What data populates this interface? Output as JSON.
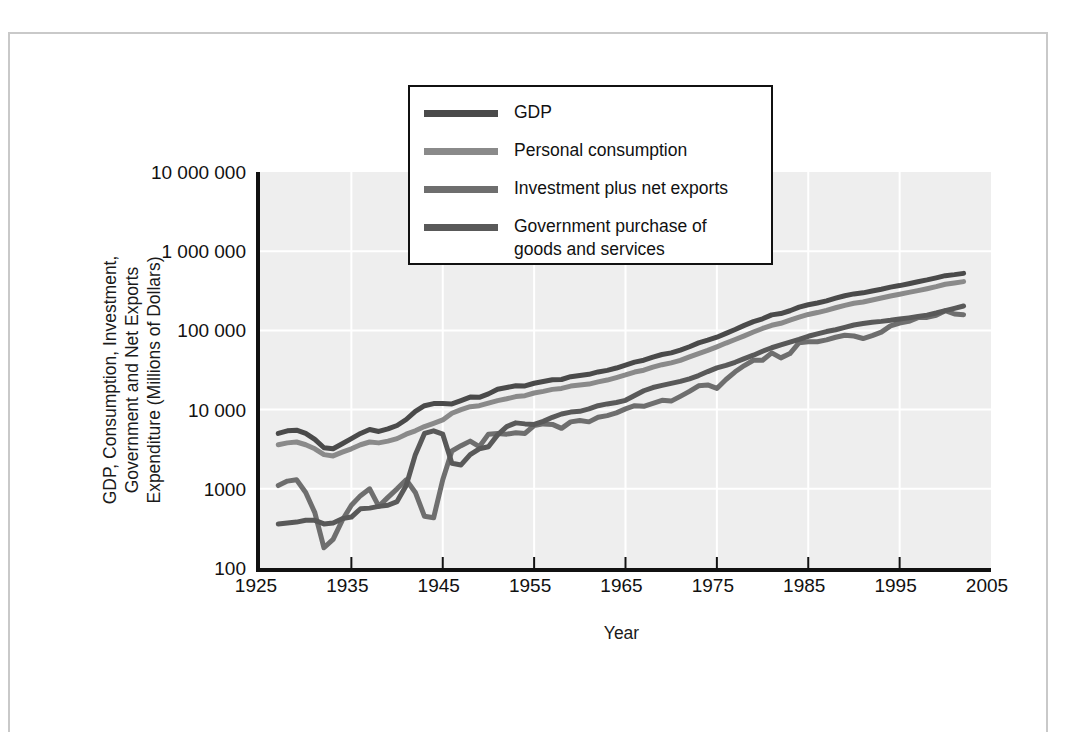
{
  "figure": {
    "x_axis_title": "Year",
    "y_axis_title_lines": [
      "GDP, Consumption, Investment,",
      "Government and Net Exports",
      "Expenditure (Millions of Dollars)"
    ]
  },
  "legend": {
    "entries": [
      {
        "label": "GDP",
        "color": "#4a4a4a"
      },
      {
        "label": "Personal consumption",
        "color": "#8a8a8a"
      },
      {
        "label": "Investment plus net exports",
        "color": "#6e6e6e"
      },
      {
        "label": "Government purchase of\ngoods and services",
        "color": "#595959"
      }
    ]
  },
  "colors": {
    "plot_background": "#eeeeee",
    "gridline": "#ffffff",
    "axis": "#111111",
    "page_border": "#c9c9c9"
  },
  "chart_data": {
    "type": "line",
    "title": "",
    "subtitle": "",
    "xlabel": "Year",
    "ylabel": "GDP, Consumption, Investment, Government and Net Exports Expenditure (Millions of Dollars)",
    "yscale": "log",
    "ylim": [
      100,
      10000000
    ],
    "xlim": [
      1925,
      2005
    ],
    "ytick_labels": [
      "10 000 000",
      "1 000 000",
      "100 000",
      "10 000",
      "1000",
      "100"
    ],
    "ytick_values": [
      10000000,
      1000000,
      100000,
      10000,
      1000,
      100
    ],
    "xtick_labels": [
      "1925",
      "1935",
      "1945",
      "1955",
      "1965",
      "1975",
      "1985",
      "1995",
      "2005"
    ],
    "xtick_values": [
      1925,
      1935,
      1945,
      1955,
      1965,
      1975,
      1985,
      1995,
      2005
    ],
    "grid": true,
    "grid_color": "#ffffff",
    "legend_position": "top-center",
    "x": [
      1927,
      1928,
      1929,
      1930,
      1931,
      1932,
      1933,
      1934,
      1935,
      1936,
      1937,
      1938,
      1939,
      1940,
      1941,
      1942,
      1943,
      1944,
      1945,
      1946,
      1947,
      1948,
      1949,
      1950,
      1951,
      1952,
      1953,
      1954,
      1955,
      1956,
      1957,
      1958,
      1959,
      1960,
      1961,
      1962,
      1963,
      1964,
      1965,
      1966,
      1967,
      1968,
      1969,
      1970,
      1971,
      1972,
      1973,
      1974,
      1975,
      1976,
      1977,
      1978,
      1979,
      1980,
      1981,
      1982,
      1983,
      1984,
      1985,
      1986,
      1987,
      1988,
      1989,
      1990,
      1991,
      1992,
      1993,
      1994,
      1995,
      1996,
      1997,
      1998,
      1999,
      2000,
      2001,
      2002
    ],
    "series": [
      {
        "name": "GDP",
        "color": "#4a4a4a",
        "values": [
          5000,
          5400,
          5500,
          5000,
          4200,
          3300,
          3200,
          3700,
          4300,
          5000,
          5600,
          5300,
          5700,
          6300,
          7500,
          9500,
          11200,
          11900,
          11900,
          11800,
          13000,
          14400,
          14300,
          15800,
          18100,
          19000,
          20000,
          19900,
          21500,
          22600,
          23800,
          24000,
          26000,
          27000,
          27900,
          29900,
          31300,
          33500,
          36400,
          39800,
          42000,
          45900,
          49600,
          52000,
          56500,
          62200,
          69500,
          75200,
          82000,
          91700,
          102500,
          115700,
          129000,
          140000,
          157000,
          163000,
          177000,
          197000,
          211000,
          222000,
          236000,
          255000,
          274000,
          289000,
          298000,
          315000,
          331000,
          352000,
          368000,
          389000,
          412000,
          434000,
          461000,
          491000,
          506000,
          525000
        ]
      },
      {
        "name": "Personal consumption",
        "color": "#8a8a8a",
        "values": [
          3600,
          3800,
          3900,
          3600,
          3200,
          2700,
          2600,
          2900,
          3200,
          3600,
          3900,
          3800,
          4000,
          4300,
          4900,
          5400,
          6100,
          6700,
          7400,
          9000,
          10000,
          10900,
          11200,
          12100,
          13000,
          13700,
          14600,
          15000,
          16200,
          17000,
          18000,
          18500,
          19800,
          20500,
          21000,
          22400,
          23600,
          25400,
          27400,
          29800,
          31400,
          34300,
          36900,
          38900,
          41800,
          46200,
          51000,
          55900,
          62000,
          69200,
          76700,
          85400,
          95400,
          105800,
          116000,
          123000,
          135000,
          147000,
          159000,
          168000,
          179000,
          193000,
          207000,
          220000,
          228000,
          242000,
          256000,
          272000,
          286000,
          302000,
          318000,
          336000,
          357000,
          383000,
          397000,
          413000
        ]
      },
      {
        "name": "Investment plus net exports",
        "color": "#6e6e6e",
        "values": [
          1100,
          1250,
          1300,
          900,
          500,
          180,
          230,
          400,
          620,
          820,
          1000,
          600,
          780,
          1000,
          1300,
          900,
          450,
          430,
          1300,
          3000,
          3500,
          4000,
          3400,
          4900,
          5000,
          4900,
          5100,
          5000,
          6300,
          6600,
          6500,
          5800,
          7000,
          7300,
          7000,
          8000,
          8400,
          9100,
          10200,
          11200,
          11000,
          12000,
          13100,
          12800,
          14700,
          17000,
          20000,
          20500,
          18500,
          24000,
          30000,
          36000,
          42000,
          42000,
          52000,
          45000,
          51000,
          70000,
          72000,
          72000,
          76000,
          82000,
          87000,
          85000,
          79000,
          86000,
          95000,
          114000,
          124000,
          130000,
          145000,
          146000,
          155000,
          177000,
          161000,
          158000
        ]
      },
      {
        "name": "Government purchase of goods and services",
        "color": "#595959",
        "values": [
          360,
          370,
          380,
          400,
          400,
          360,
          370,
          420,
          440,
          560,
          570,
          600,
          620,
          690,
          1100,
          2700,
          5000,
          5400,
          4900,
          2100,
          2000,
          2700,
          3200,
          3400,
          4800,
          6100,
          6800,
          6600,
          6500,
          7100,
          8000,
          8800,
          9300,
          9500,
          10200,
          11200,
          11800,
          12300,
          13100,
          15100,
          17300,
          19000,
          20200,
          21400,
          22700,
          24500,
          26900,
          30200,
          33600,
          36200,
          39600,
          44100,
          48600,
          54500,
          60400,
          65600,
          71100,
          77100,
          84300,
          90400,
          96700,
          102000,
          109000,
          117000,
          122000,
          127000,
          130000,
          134000,
          139000,
          144000,
          150000,
          156000,
          166000,
          178000,
          190000,
          203000
        ]
      }
    ]
  }
}
